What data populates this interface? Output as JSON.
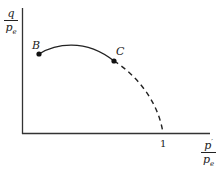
{
  "diagram": {
    "y_axis_label": {
      "numerator": "q",
      "denominator": "p",
      "denominator_sub": "e"
    },
    "x_axis_label": {
      "numerator": "p",
      "numerator_sup": "′",
      "denominator": "p",
      "denominator_sub": "e"
    },
    "x_tick_label": "1",
    "points": [
      {
        "label": "B"
      },
      {
        "label": "C"
      }
    ],
    "curve": {
      "solid_segment": "B to C",
      "dashed_segment": "C to (1, 0)"
    },
    "colors": {
      "ink": "#222222",
      "background": "#ffffff"
    }
  }
}
